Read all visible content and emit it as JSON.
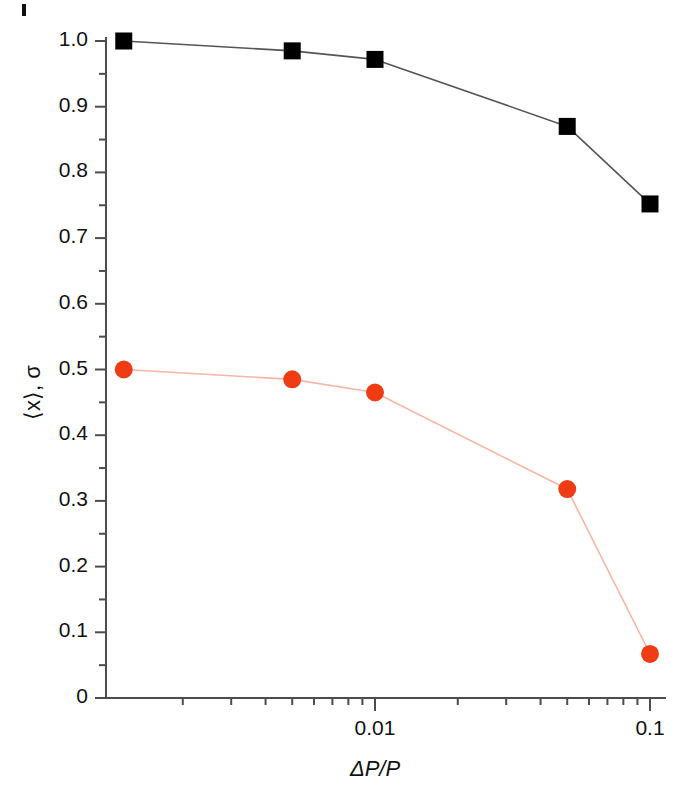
{
  "figure": {
    "background": "#ffffff",
    "axis_color": "#4d4d4d",
    "corner_mark": "page-edge-mark"
  },
  "axes": {
    "y_title": "⟨x⟩, σ",
    "x_title": "ΔP/P",
    "y_ticks": [
      "0",
      "0.1",
      "0.2",
      "0.3",
      "0.4",
      "0.5",
      "0.6",
      "0.7",
      "0.8",
      "0.9",
      "1.0"
    ],
    "x_ticks": [
      "0.01",
      "0.1"
    ]
  },
  "chart_data": {
    "type": "line",
    "title": "",
    "subtitle": "",
    "xlabel": "ΔP/P",
    "ylabel": "⟨x⟩, σ",
    "xscale": "log",
    "yscale": "linear",
    "xlim": [
      0.00122,
      0.1
    ],
    "ylim": [
      0,
      1.0
    ],
    "grid": false,
    "legend": "none",
    "x_tick_values": [
      0.01,
      0.1
    ],
    "x_tick_labels": [
      "0.01",
      "0.1"
    ],
    "y_tick_values": [
      0,
      0.1,
      0.2,
      0.3,
      0.4,
      0.5,
      0.6,
      0.7,
      0.8,
      0.9,
      1.0
    ],
    "y_tick_labels": [
      "0",
      "0.1",
      "0.2",
      "0.3",
      "0.4",
      "0.5",
      "0.6",
      "0.7",
      "0.8",
      "0.9",
      "1.0"
    ],
    "y_minor_tick_values": [
      0.05,
      0.15,
      0.25,
      0.35,
      0.45,
      0.55,
      0.65,
      0.75,
      0.85,
      0.95
    ],
    "x": [
      0.00122,
      0.005,
      0.01,
      0.05,
      0.1
    ],
    "series": [
      {
        "name": "⟨x⟩",
        "marker": "square",
        "color": "#000000",
        "line_color": "#555555",
        "values": [
          1.0,
          0.985,
          0.972,
          0.87,
          0.752
        ]
      },
      {
        "name": "σ",
        "marker": "circle",
        "color": "#f03c14",
        "line_color": "#f8b6a6",
        "values": [
          0.5,
          0.485,
          0.465,
          0.318,
          0.067
        ]
      }
    ]
  }
}
